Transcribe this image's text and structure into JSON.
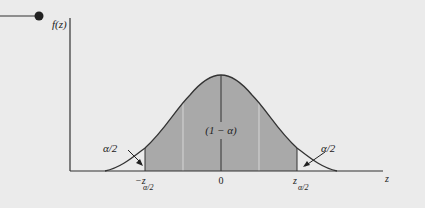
{
  "diagram": {
    "type": "normal-distribution-two-tailed",
    "y_axis_label": "f(z)",
    "x_axis_label": "z",
    "center_label": "(1 − α)",
    "left_tail_label": "α/2",
    "right_tail_label": "α/2",
    "tick_labels": {
      "left": {
        "main": "−z",
        "sub": "α/2"
      },
      "center": "0",
      "right": {
        "main": "z",
        "sub": "α/2"
      }
    },
    "colors": {
      "background": "#ebebeb",
      "shaded_region": "#a9a9a9",
      "curve": "#333333",
      "axis": "#333333",
      "sigma_lines": "#d6d6d6"
    }
  }
}
